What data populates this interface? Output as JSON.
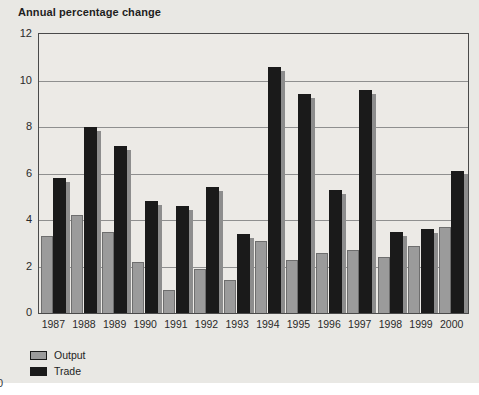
{
  "title": "Annual percentage change",
  "page_artifact": "0",
  "colors": {
    "panel_background": "#e9e8e4",
    "plot_background": "#eceae6",
    "gridline": "#8f8f8f",
    "plot_border": "#4a4a4a",
    "output_bar": "#9b9b9b",
    "trade_bar": "#1a1a1a",
    "trade_bar_shadow": "#8d8d8d"
  },
  "chart_data": {
    "type": "bar",
    "title": "Annual percentage change",
    "categories": [
      "1987",
      "1988",
      "1989",
      "1990",
      "1991",
      "1992",
      "1993",
      "1994",
      "1995",
      "1996",
      "1997",
      "1998",
      "1999",
      "2000"
    ],
    "series": [
      {
        "name": "Output",
        "color": "#9b9b9b",
        "values": [
          3.3,
          4.2,
          3.5,
          2.2,
          1.0,
          1.9,
          1.4,
          3.1,
          2.3,
          2.6,
          2.7,
          2.4,
          2.9,
          3.7
        ]
      },
      {
        "name": "Trade",
        "color": "#1a1a1a",
        "values": [
          5.8,
          8.0,
          7.2,
          4.8,
          4.6,
          5.4,
          3.4,
          10.6,
          9.4,
          5.3,
          9.6,
          3.5,
          3.6,
          6.1
        ]
      }
    ],
    "xlabel": "",
    "ylabel": "",
    "ylim": [
      0,
      12
    ],
    "yticks": [
      0,
      2,
      4,
      6,
      8,
      10,
      12
    ],
    "grid": true,
    "legend_position": "bottom-left"
  }
}
